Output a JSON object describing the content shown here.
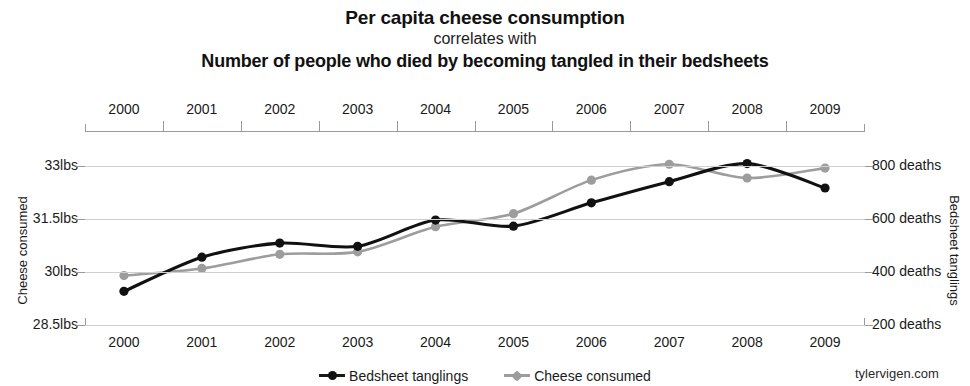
{
  "header": {
    "title_main": "Per capita cheese consumption",
    "title_connector": "correlates with",
    "title_sub": "Number of people who died by becoming tangled in their bedsheets"
  },
  "credit": "tylervigen.com",
  "legend": {
    "items": [
      {
        "label": "Bedsheet tanglings",
        "color": "#111111",
        "marker": "circle"
      },
      {
        "label": "Cheese consumed",
        "color": "#9d9d9d",
        "marker": "diamond"
      }
    ]
  },
  "axes": {
    "x_top_labels": [
      "2000",
      "2001",
      "2002",
      "2003",
      "2004",
      "2005",
      "2006",
      "2007",
      "2008",
      "2009"
    ],
    "x_bottom_labels": [
      "2000",
      "2001",
      "2002",
      "2003",
      "2004",
      "2005",
      "2006",
      "2007",
      "2008",
      "2009"
    ],
    "y_left_title": "Cheese consumed",
    "y_left_labels": [
      "33lbs",
      "31.5lbs",
      "30lbs",
      "28.5lbs"
    ],
    "y_right_title": "Bedsheet tanglings",
    "y_right_labels": [
      "800 deaths",
      "600 deaths",
      "400 deaths",
      "200 deaths"
    ]
  },
  "chart_data": {
    "type": "line",
    "title": "Per capita cheese consumption correlates with Number of people who died by becoming tangled in their bedsheets",
    "subtitle": "correlates with",
    "xlabel": "",
    "x": [
      2000,
      2001,
      2002,
      2003,
      2004,
      2005,
      2006,
      2007,
      2008,
      2009
    ],
    "categories": [
      "2000",
      "2001",
      "2002",
      "2003",
      "2004",
      "2005",
      "2006",
      "2007",
      "2008",
      "2009"
    ],
    "grid": true,
    "legend_position": "bottom",
    "series": [
      {
        "name": "Cheese consumed",
        "color": "#9d9d9d",
        "axis": "left",
        "unit": "lbs",
        "ylabel": "Cheese consumed",
        "ylim": [
          28.5,
          33.5
        ],
        "yticks": [
          28.5,
          30,
          31.5,
          33
        ],
        "ytick_labels": [
          "28.5lbs",
          "30lbs",
          "31.5lbs",
          "33lbs"
        ],
        "values": [
          29.9,
          30.1,
          30.5,
          30.57,
          31.28,
          31.65,
          32.6,
          33.05,
          32.66,
          32.94
        ]
      },
      {
        "name": "Bedsheet tanglings",
        "color": "#111111",
        "axis": "right",
        "unit": "deaths",
        "ylabel": "Bedsheet tanglings",
        "ylim": [
          200,
          800
        ],
        "yticks": [
          200,
          400,
          600,
          800
        ],
        "ytick_labels": [
          "200 deaths",
          "400 deaths",
          "600 deaths",
          "800 deaths"
        ],
        "values": [
          327,
          456,
          509,
          497,
          596,
          573,
          661,
          741,
          809,
          717
        ]
      }
    ]
  }
}
